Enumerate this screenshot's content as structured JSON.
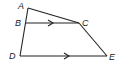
{
  "diagram": {
    "type": "geometry",
    "points": {
      "A": {
        "label": "A",
        "x": 28,
        "y": 8
      },
      "B": {
        "label": "B",
        "x": 26,
        "y": 23
      },
      "C": {
        "label": "C",
        "x": 79,
        "y": 23
      },
      "D": {
        "label": "D",
        "x": 20,
        "y": 56
      },
      "E": {
        "label": "E",
        "x": 107,
        "y": 56
      }
    },
    "segments": [
      "AC",
      "AD",
      "BC",
      "CE",
      "DE"
    ],
    "parallel": [
      [
        "BC",
        "DE"
      ]
    ],
    "colors": {
      "stroke": "#222222",
      "background": "#ffffff"
    }
  }
}
